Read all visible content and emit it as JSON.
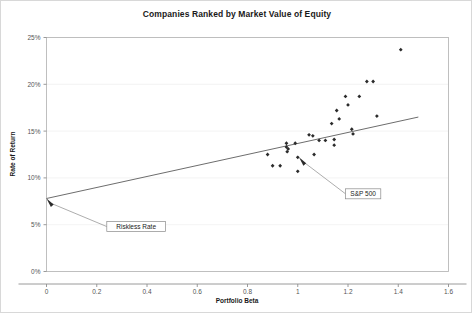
{
  "chart_data": {
    "type": "scatter",
    "title": "Companies Ranked by Market Value of Equity",
    "xlabel": "Portfolio Beta",
    "ylabel": "Rate of Return",
    "xlim": [
      0,
      1.6
    ],
    "ylim": [
      0,
      0.25
    ],
    "grid": true,
    "legend": false,
    "xticks": [
      "0",
      "0.2",
      "0.4",
      "0.6",
      "0.8",
      "1",
      "1.2",
      "1.4",
      "1.6"
    ],
    "xtick_values": [
      0,
      0.2,
      0.4,
      0.6,
      0.8,
      1.0,
      1.2,
      1.4,
      1.6
    ],
    "yticks": [
      "0%",
      "5%",
      "10%",
      "15%",
      "20%",
      "25%"
    ],
    "ytick_values": [
      0,
      0.05,
      0.1,
      0.15,
      0.2,
      0.25
    ],
    "series": [
      {
        "name": "Portfolios",
        "marker": "diamond",
        "color": "#2b2b2b",
        "points": [
          [
            0.88,
            0.125
          ],
          [
            0.9,
            0.113
          ],
          [
            0.93,
            0.113
          ],
          [
            0.955,
            0.137
          ],
          [
            0.955,
            0.133
          ],
          [
            0.962,
            0.131
          ],
          [
            0.958,
            0.128
          ],
          [
            0.99,
            0.137
          ],
          [
            1.0,
            0.122
          ],
          [
            1.0,
            0.107
          ],
          [
            1.045,
            0.146
          ],
          [
            1.06,
            0.145
          ],
          [
            1.065,
            0.125
          ],
          [
            1.085,
            0.14
          ],
          [
            1.11,
            0.14
          ],
          [
            1.135,
            0.158
          ],
          [
            1.145,
            0.141
          ],
          [
            1.145,
            0.135
          ],
          [
            1.155,
            0.172
          ],
          [
            1.165,
            0.163
          ],
          [
            1.19,
            0.187
          ],
          [
            1.2,
            0.178
          ],
          [
            1.215,
            0.152
          ],
          [
            1.22,
            0.147
          ],
          [
            1.245,
            0.187
          ],
          [
            1.275,
            0.203
          ],
          [
            1.3,
            0.203
          ],
          [
            1.315,
            0.166
          ],
          [
            1.41,
            0.237
          ]
        ]
      }
    ],
    "trendline": {
      "name": "Security Market Line",
      "x_start": 0.0,
      "y_start": 0.078,
      "x_end": 1.48,
      "y_end": 0.165,
      "color": "#6d6d6d"
    },
    "annotations": [
      {
        "label": "S&P 500",
        "point_x": 1.005,
        "point_y": 0.122,
        "box_x": 1.19,
        "box_y": 0.083
      },
      {
        "label": "Riskless Rate",
        "point_x": 0.0,
        "point_y": 0.078,
        "box_x": 0.24,
        "box_y": 0.048
      }
    ]
  },
  "chart": {
    "title": "Companies Ranked by Market Value of Equity",
    "x_axis_title": "Portfolio Beta",
    "y_axis_title": "Rate of Return",
    "x_tick_labels": [
      "0",
      "0.2",
      "0.4",
      "0.6",
      "0.8",
      "1",
      "1.2",
      "1.4",
      "1.6"
    ],
    "y_tick_labels": [
      "25%",
      "20%",
      "15%",
      "10%",
      "5%",
      "0%"
    ],
    "annotation_sp500": "S&P 500",
    "annotation_riskless": "Riskless Rate",
    "colors": {
      "marker": "#2b2b2b",
      "trendline": "#6d6d6d",
      "gridline": "#f0f0f0",
      "border": "#b9b9b9",
      "text": "#1a1a1a"
    }
  }
}
